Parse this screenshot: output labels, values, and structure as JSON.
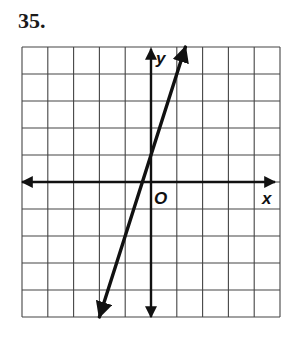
{
  "problem": {
    "number": "35."
  },
  "colors": {
    "grid": "#444444",
    "axis": "#111111",
    "line": "#111111",
    "background": "#ffffff"
  },
  "chart_data": {
    "type": "line",
    "title": "",
    "xlabel": "x",
    "ylabel": "y",
    "origin_label": "O",
    "xlim": [
      -5,
      5
    ],
    "ylim": [
      -5,
      5
    ],
    "grid": true,
    "grid_step": 1,
    "tick_labels": false,
    "series": [
      {
        "name": "line",
        "equation": "y = 3x + 1",
        "slope": 3,
        "intercept": 1,
        "x": [
          -2,
          1.333
        ],
        "y": [
          -5,
          5
        ],
        "arrows": "both"
      }
    ]
  }
}
